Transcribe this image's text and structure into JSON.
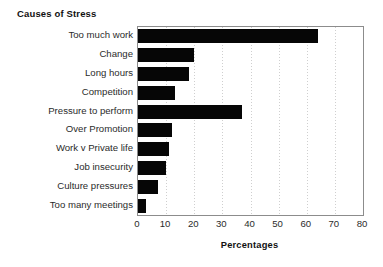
{
  "chart_data": {
    "type": "bar",
    "orientation": "horizontal",
    "title": "Causes of Stress",
    "xlabel": "Percentages",
    "ylabel": "",
    "xlim": [
      0,
      80
    ],
    "xticks": [
      "0",
      "10",
      "20",
      "30",
      "40",
      "50",
      "60",
      "70",
      "80"
    ],
    "grid": true,
    "grid_axis": "x",
    "legend": "none",
    "bar_color": "#060606",
    "categories": [
      "Too much work",
      "Change",
      "Long hours",
      "Competition",
      "Pressure to perform",
      "Over Promotion",
      "Work v Private life",
      "Job insecurity",
      "Culture pressures",
      "Too many meetings"
    ],
    "values": [
      64,
      20,
      18,
      13,
      37,
      12,
      11,
      10,
      7,
      3
    ]
  },
  "axis": {
    "tick_0": "0",
    "tick_1": "10",
    "tick_2": "20",
    "tick_3": "30",
    "tick_4": "40",
    "tick_5": "50",
    "tick_6": "60",
    "tick_7": "70",
    "tick_8": "80"
  }
}
